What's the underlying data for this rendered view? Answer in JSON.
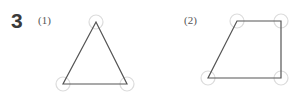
{
  "problem": {
    "number": "3",
    "parts": [
      {
        "label": "(1)",
        "shape": "triangle",
        "vertices": [
          [
            96,
            22
          ],
          [
            63,
            84
          ],
          [
            127,
            84
          ]
        ]
      },
      {
        "label": "(2)",
        "shape": "quadrilateral",
        "vertices": [
          [
            237,
            21
          ],
          [
            281,
            21
          ],
          [
            281,
            78
          ],
          [
            208,
            78
          ]
        ]
      }
    ]
  },
  "colors": {
    "line": "#555555",
    "circle": "#d9d9d9",
    "number": "#3a3a3a"
  }
}
